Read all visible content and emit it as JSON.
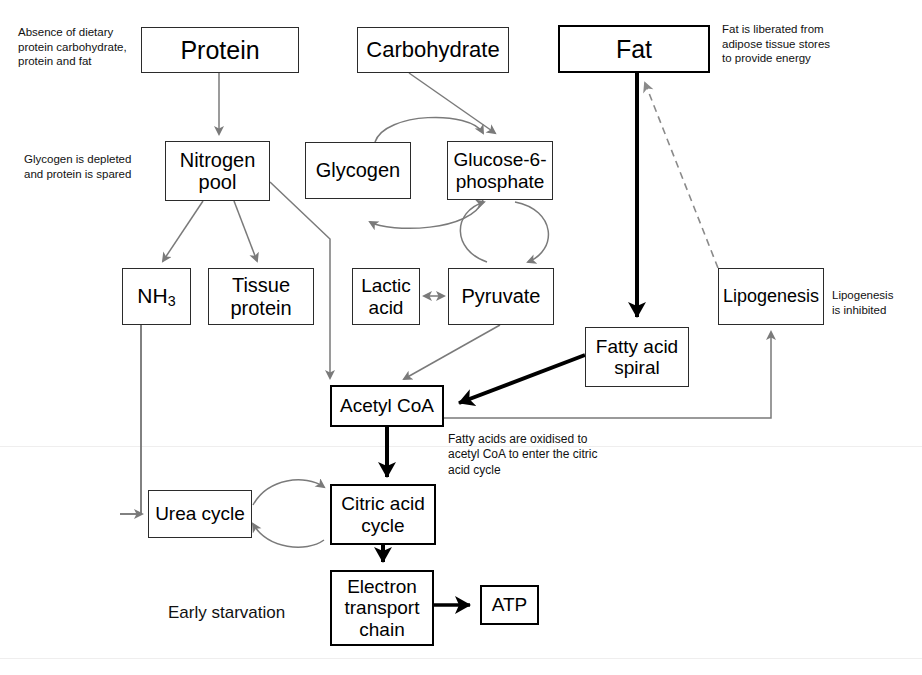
{
  "diagram": {
    "caption": "Early starvation",
    "colors": {
      "box_border": "#2b2b2b",
      "thick_border": "#000000",
      "thin_arrow": "#7a7a7a",
      "thick_arrow": "#000000",
      "dashed_arrow": "#8a8a8a",
      "text": "#000000",
      "background": "#ffffff"
    },
    "nodes": [
      {
        "id": "protein",
        "label": "Protein",
        "x": 141,
        "y": 27,
        "w": 158,
        "h": 46,
        "font": 25,
        "weight": "thin"
      },
      {
        "id": "carbohydrate",
        "label": "Carbohydrate",
        "x": 357,
        "y": 27,
        "w": 152,
        "h": 46,
        "font": 22,
        "weight": "thin"
      },
      {
        "id": "fat",
        "label": "Fat",
        "x": 558,
        "y": 25,
        "w": 152,
        "h": 48,
        "font": 25,
        "weight": "thick"
      },
      {
        "id": "nitrogen",
        "label": "Nitrogen\npool",
        "x": 165,
        "y": 141,
        "w": 105,
        "h": 60,
        "font": 20,
        "weight": "thin"
      },
      {
        "id": "glycogen",
        "label": "Glycogen",
        "x": 305,
        "y": 142,
        "w": 106,
        "h": 57,
        "font": 20,
        "weight": "thin"
      },
      {
        "id": "g6p",
        "label": "Glucose-6-\nphosphate",
        "x": 447,
        "y": 141,
        "w": 106,
        "h": 59,
        "font": 19,
        "weight": "thin"
      },
      {
        "id": "nh3",
        "label": "NH3",
        "x": 122,
        "y": 268,
        "w": 69,
        "h": 57,
        "font": 21,
        "weight": "thin",
        "html": "NH<sub>3</sub>"
      },
      {
        "id": "tissue",
        "label": "Tissue\nprotein",
        "x": 208,
        "y": 268,
        "w": 106,
        "h": 57,
        "font": 20,
        "weight": "thin"
      },
      {
        "id": "lactic",
        "label": "Lactic\nacid",
        "x": 352,
        "y": 268,
        "w": 68,
        "h": 57,
        "font": 19,
        "weight": "thin"
      },
      {
        "id": "pyruvate",
        "label": "Pyruvate",
        "x": 448,
        "y": 268,
        "w": 106,
        "h": 57,
        "font": 20,
        "weight": "thin"
      },
      {
        "id": "lipogenesis",
        "label": "Lipogenesis",
        "x": 718,
        "y": 268,
        "w": 106,
        "h": 57,
        "font": 18,
        "weight": "thin"
      },
      {
        "id": "fattyacid",
        "label": "Fatty acid\nspiral",
        "x": 585,
        "y": 327,
        "w": 104,
        "h": 60,
        "font": 19,
        "weight": "thin"
      },
      {
        "id": "acetylcoa",
        "label": "Acetyl CoA",
        "x": 330,
        "y": 385,
        "w": 114,
        "h": 42,
        "font": 19,
        "weight": "thick"
      },
      {
        "id": "urea",
        "label": "Urea cycle",
        "x": 148,
        "y": 490,
        "w": 104,
        "h": 48,
        "font": 19,
        "weight": "thin"
      },
      {
        "id": "citric",
        "label": "Citric acid\ncycle",
        "x": 330,
        "y": 484,
        "w": 106,
        "h": 61,
        "font": 19,
        "weight": "thick"
      },
      {
        "id": "etc",
        "label": "Electron\ntransport\nchain",
        "x": 330,
        "y": 570,
        "w": 104,
        "h": 76,
        "font": 19,
        "weight": "thick"
      },
      {
        "id": "atp",
        "label": "ATP",
        "x": 480,
        "y": 585,
        "w": 59,
        "h": 40,
        "font": 19,
        "weight": "thick"
      }
    ],
    "annotations": [
      {
        "id": "absence-note",
        "text": "Absence of dietary\nprotein carbohydrate,\nprotein and fat",
        "x": 18,
        "y": 25,
        "w": 130,
        "font": 11.5,
        "align": "left"
      },
      {
        "id": "glycogen-note",
        "text": "Glycogen is depleted\nand protein is spared",
        "x": 24,
        "y": 152,
        "w": 140,
        "font": 11.5,
        "align": "left"
      },
      {
        "id": "fat-note",
        "text": "Fat is liberated from\nadipose tissue stores\nto provide energy",
        "x": 722,
        "y": 22,
        "w": 150,
        "font": 11.5,
        "align": "left"
      },
      {
        "id": "lipogenesis-note",
        "text": "Lipogenesis\nis inhibited",
        "x": 832,
        "y": 288,
        "w": 88,
        "font": 11.5,
        "align": "left"
      },
      {
        "id": "fattyacid-note",
        "text": "Fatty acids are oxidised to\nacetyl CoA to enter the citric\nacid cycle",
        "x": 448,
        "y": 432,
        "w": 220,
        "font": 12,
        "align": "left"
      }
    ],
    "caption_label": {
      "text": "Early starvation",
      "x": 168,
      "y": 603,
      "font": 17
    },
    "edges": [
      {
        "id": "protein-to-nitrogen",
        "from": "protein",
        "to": "nitrogen",
        "style": "thin-arrow"
      },
      {
        "id": "carbohydrate-to-g6p",
        "from": "carbohydrate",
        "to": "g6p",
        "style": "thin-arrow"
      },
      {
        "id": "fat-to-fattyacid",
        "from": "fat",
        "to": "fattyacid",
        "style": "thick-arrow"
      },
      {
        "id": "glycogen-g6p-cycle",
        "from": "glycogen",
        "to": "g6p",
        "style": "thin-curved-double"
      },
      {
        "id": "g6p-pyruvate-cycle",
        "from": "g6p",
        "to": "pyruvate",
        "style": "thin-ellipse-double"
      },
      {
        "id": "nitrogen-to-nh3",
        "from": "nitrogen",
        "to": "nh3",
        "style": "thin-arrow"
      },
      {
        "id": "nitrogen-to-tissue",
        "from": "nitrogen",
        "to": "tissue",
        "style": "thin-arrow"
      },
      {
        "id": "nitrogen-to-acetylcoa",
        "from": "nitrogen",
        "to": "acetylcoa",
        "style": "thin-arrow"
      },
      {
        "id": "lactic-pyruvate",
        "from": "lactic",
        "to": "pyruvate",
        "style": "thin-double-arrow"
      },
      {
        "id": "pyruvate-to-acetylcoa",
        "from": "pyruvate",
        "to": "acetylcoa",
        "style": "thin-arrow"
      },
      {
        "id": "fattyacid-to-acetylcoa",
        "from": "fattyacid",
        "to": "acetylcoa",
        "style": "thick-arrow"
      },
      {
        "id": "acetylcoa-to-lipogenesis",
        "from": "acetylcoa",
        "to": "lipogenesis",
        "style": "thin-arrow"
      },
      {
        "id": "lipogenesis-to-fat",
        "from": "lipogenesis",
        "to": "fat",
        "style": "dashed-arrow"
      },
      {
        "id": "nh3-to-urea",
        "from": "nh3",
        "to": "urea",
        "style": "thin-arrow"
      },
      {
        "id": "urea-citric-cycle",
        "from": "urea",
        "to": "citric",
        "style": "thin-circle-double"
      },
      {
        "id": "acetylcoa-to-citric",
        "from": "acetylcoa",
        "to": "citric",
        "style": "thick-arrow"
      },
      {
        "id": "citric-to-etc",
        "from": "citric",
        "to": "etc",
        "style": "thick-arrow"
      },
      {
        "id": "etc-to-atp",
        "from": "etc",
        "to": "atp",
        "style": "thick-arrow"
      }
    ]
  }
}
